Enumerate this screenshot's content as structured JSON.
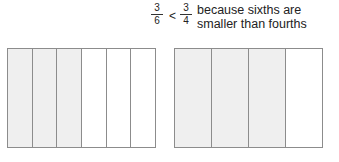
{
  "comparison": {
    "left_fraction": {
      "numerator": "3",
      "denominator": "6"
    },
    "operator": "<",
    "right_fraction": {
      "numerator": "3",
      "denominator": "4"
    },
    "explanation": "because sixths are smaller than fourths"
  },
  "models": [
    {
      "name": "sixths",
      "parts": 6,
      "shaded": 3
    },
    {
      "name": "fourths",
      "parts": 4,
      "shaded": 3
    }
  ],
  "colors": {
    "shaded": "#efefef",
    "border": "#8c8c8c"
  }
}
